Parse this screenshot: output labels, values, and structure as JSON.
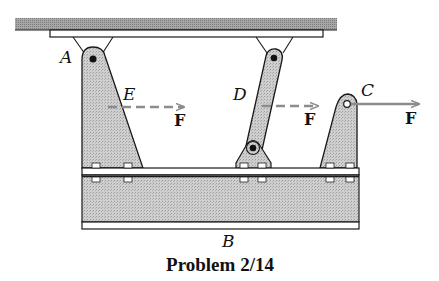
{
  "figure": {
    "caption": "Problem 2/14",
    "labels": {
      "A": "A",
      "B": "B",
      "C": "C",
      "D": "D",
      "E": "E"
    },
    "forces": [
      {
        "id": "force-E",
        "label": "F",
        "at": "E",
        "style": "dashed",
        "direction": "right"
      },
      {
        "id": "force-D",
        "label": "F",
        "at": "D",
        "style": "dashed",
        "direction": "right"
      },
      {
        "id": "force-C",
        "label": "F",
        "at": "C",
        "style": "solid",
        "direction": "right"
      }
    ],
    "components": [
      "ceiling support",
      "mounting plate",
      "pin bracket at A",
      "tapered gusset plate at A",
      "two-force link D",
      "pin bracket at D",
      "gusset plate at C",
      "I-beam B"
    ]
  },
  "colors": {
    "fill_gray": "#c4c4c4",
    "ceiling_gray": "#9a9a9a",
    "stroke": "#1a1a1a",
    "arrow": "#8c8c8c"
  }
}
